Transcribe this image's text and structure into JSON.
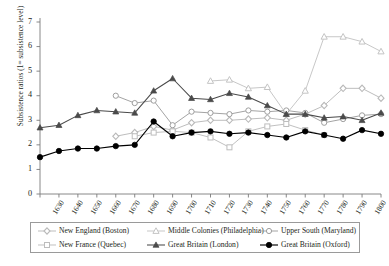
{
  "chart_data": {
    "type": "line",
    "title": "",
    "xlabel": "",
    "ylabel": "Subsistence ratios (1= subsistence level)",
    "ylim": [
      0,
      7
    ],
    "ytick_labels": [
      "0",
      "1",
      "2",
      "3",
      "4",
      "5",
      "6",
      "7"
    ],
    "grid": false,
    "legend_position": "bottom",
    "x": [
      1630,
      1640,
      1650,
      1660,
      1670,
      1680,
      1690,
      1700,
      1710,
      1720,
      1730,
      1740,
      1750,
      1760,
      1770,
      1780,
      1790,
      1800,
      1810
    ],
    "xtick_labels": [
      "1630",
      "1640",
      "1650",
      "1660",
      "1670",
      "1680",
      "1690",
      "1700",
      "1710",
      "1720",
      "1730",
      "1740",
      "1750",
      "1760",
      "1770",
      "1780",
      "1790",
      "1800",
      "1810"
    ],
    "series": [
      {
        "name": "New England (Boston)",
        "marker": "diamond-open-light",
        "color": "#b9b9b9",
        "values": [
          null,
          null,
          null,
          null,
          2.35,
          2.5,
          2.75,
          2.6,
          2.9,
          3.0,
          3.0,
          3.05,
          3.1,
          3.0,
          3.25,
          3.6,
          4.3,
          4.3,
          3.9
        ]
      },
      {
        "name": "Middle Colonies (Philadelphia)",
        "marker": "triangle-open-light",
        "color": "#c4c4c4",
        "values": [
          null,
          null,
          null,
          null,
          null,
          null,
          null,
          null,
          null,
          4.6,
          4.65,
          4.3,
          4.35,
          3.25,
          4.2,
          6.4,
          6.4,
          6.2,
          5.8
        ]
      },
      {
        "name": "Upper South (Maryland)",
        "marker": "circle-open",
        "color": "#9e9e9e",
        "values": [
          null,
          null,
          null,
          null,
          4.0,
          3.7,
          3.8,
          2.8,
          3.35,
          3.3,
          3.25,
          3.4,
          3.35,
          3.4,
          3.3,
          2.9,
          3.05,
          3.2,
          3.25
        ]
      },
      {
        "name": "New France (Quebec)",
        "marker": "square-open-light",
        "color": "#bdbdbd",
        "values": [
          null,
          null,
          null,
          null,
          null,
          2.35,
          2.5,
          2.55,
          2.5,
          2.3,
          1.9,
          2.55,
          2.75,
          2.85,
          2.6,
          2.4,
          null,
          null,
          null
        ]
      },
      {
        "name": "Great Britain (London)",
        "marker": "triangle-filled-dark",
        "color": "#4a4a4a",
        "values": [
          2.7,
          2.8,
          3.2,
          3.4,
          3.35,
          3.3,
          4.2,
          4.7,
          3.9,
          3.85,
          4.1,
          3.95,
          3.6,
          3.25,
          3.25,
          3.1,
          3.15,
          3.0,
          3.3
        ]
      },
      {
        "name": "Great Britain (Oxford)",
        "marker": "circle-filled-black",
        "color": "#000000",
        "values": [
          1.5,
          1.75,
          1.85,
          1.85,
          1.95,
          2.0,
          2.95,
          2.35,
          2.5,
          2.55,
          2.45,
          2.5,
          2.4,
          2.3,
          2.55,
          2.4,
          2.25,
          2.6,
          2.45
        ]
      }
    ]
  },
  "legend": {
    "items": [
      {
        "label": "New England (Boston)"
      },
      {
        "label": "Middle Colonies (Philadelphia)"
      },
      {
        "label": "Upper South (Maryland)"
      },
      {
        "label": "New France (Quebec)"
      },
      {
        "label": "Great Britain (London)"
      },
      {
        "label": "Great Britain (Oxford)"
      }
    ]
  }
}
